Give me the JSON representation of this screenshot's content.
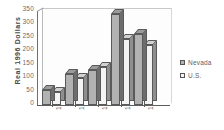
{
  "chart_data": {
    "type": "bar",
    "title": "",
    "xlabel": "",
    "ylabel": "Real  1996  Dollars",
    "categories": [
      "1962",
      "1972",
      "1982",
      "1992",
      "1996"
    ],
    "series": [
      {
        "name": "Nevada",
        "values": [
          55,
          115,
          130,
          340,
          265
        ],
        "color": "#b2b2b2"
      },
      {
        "name": "U.S.",
        "values": [
          50,
          100,
          140,
          245,
          225
        ],
        "color": "#f4f4f4"
      }
    ],
    "ylim": [
      0,
      350
    ],
    "yticks": [
      "0",
      "50",
      "100",
      "150",
      "200",
      "250",
      "300",
      "350"
    ],
    "grid": false,
    "legend_position": "right",
    "style": "3d-clustered-column"
  },
  "legend": {
    "items": [
      {
        "label": "Nevada",
        "swatch": "#b2b2b2"
      },
      {
        "label": "U.S.",
        "swatch": "#f4f4f4"
      }
    ]
  }
}
